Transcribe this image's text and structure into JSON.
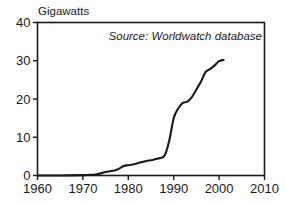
{
  "chart_data": {
    "type": "line",
    "title": "",
    "ylabel": "Gigawatts",
    "xlabel": "",
    "annotation": "Source: Worldwatch database",
    "grid": false,
    "legend": false,
    "xlim": [
      1960,
      2010
    ],
    "ylim": [
      0,
      40
    ],
    "xticks": [
      "1960",
      "1970",
      "1980",
      "1990",
      "2000",
      "2010"
    ],
    "xtick_values": [
      1960,
      1970,
      1980,
      1990,
      2000,
      2010
    ],
    "yticks": [
      "0",
      "10",
      "20",
      "30",
      "40"
    ],
    "ytick_values": [
      0,
      10,
      20,
      30,
      40
    ],
    "series": [
      {
        "name": "Installed wind capacity",
        "x": [
          1960,
          1965,
          1970,
          1972,
          1973,
          1974,
          1975,
          1976,
          1977,
          1978,
          1979,
          1980,
          1981,
          1982,
          1983,
          1984,
          1985,
          1986,
          1987,
          1988,
          1989,
          1990,
          1991,
          1992,
          1993,
          1994,
          1995,
          1996,
          1997,
          1998,
          1999,
          2000,
          2001
        ],
        "values": [
          0.0,
          0.0,
          0.1,
          0.2,
          0.3,
          0.6,
          0.9,
          1.1,
          1.3,
          1.8,
          2.5,
          2.7,
          2.9,
          3.2,
          3.5,
          3.8,
          4.0,
          4.3,
          4.6,
          5.2,
          9.0,
          15.0,
          17.5,
          19.0,
          19.3,
          20.5,
          22.5,
          24.5,
          27.0,
          27.8,
          28.8,
          29.9,
          30.2
        ]
      }
    ]
  },
  "axes": {
    "y_axis_title": "Gigawatts",
    "annotation": "Source: Worldwatch database"
  },
  "colors": {
    "line": "#1a1a1a",
    "frame": "#1a1a1a",
    "background": "#ffffff",
    "text": "#1a1a1a"
  }
}
